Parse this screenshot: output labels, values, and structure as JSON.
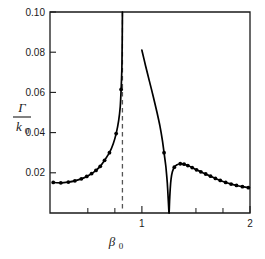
{
  "chart_data": {
    "type": "line",
    "title": "",
    "subtitle": "",
    "xlabel": "β₀",
    "ylabel": "Γ / k₀",
    "ylabel_numerator": "Γ",
    "ylabel_denominator": "k₀",
    "xlim": [
      0.15,
      2.0
    ],
    "ylim": [
      0.0,
      0.1
    ],
    "grid": false,
    "legend": null,
    "x_ticks_labeled": [
      1,
      2
    ],
    "x_tick_labels": [
      "1",
      "2"
    ],
    "x_ticks_minor": [
      0.5,
      0.75,
      1.25,
      1.5,
      1.75
    ],
    "y_ticks_labeled": [
      0.02,
      0.04,
      0.06,
      0.08,
      0.1
    ],
    "y_tick_labels": [
      "0.02",
      "0.04",
      "0.06",
      "0.08",
      "0.10"
    ],
    "annotations": [
      {
        "name": "vertical-asymptote",
        "type": "dashed-vertical-line",
        "x": 0.82,
        "label": ""
      }
    ],
    "series": [
      {
        "name": "lower-branch",
        "style": "solid-line-with-markers",
        "color": "#000000",
        "points": [
          [
            0.18,
            0.0152
          ],
          [
            0.25,
            0.015
          ],
          [
            0.32,
            0.0154
          ],
          [
            0.38,
            0.016
          ],
          [
            0.44,
            0.017
          ],
          [
            0.49,
            0.0182
          ],
          [
            0.535,
            0.0196
          ],
          [
            0.575,
            0.0212
          ],
          [
            0.615,
            0.0232
          ],
          [
            0.655,
            0.0262
          ],
          [
            0.7,
            0.03
          ],
          [
            0.735,
            0.0345
          ],
          [
            0.762,
            0.0395
          ],
          [
            0.785,
            0.046
          ],
          [
            0.8,
            0.053
          ],
          [
            0.808,
            0.0615
          ],
          [
            0.815,
            0.072
          ],
          [
            0.818,
            0.086
          ],
          [
            0.82,
            0.1
          ]
        ],
        "markers": [
          [
            0.18,
            0.0152
          ],
          [
            0.25,
            0.015
          ],
          [
            0.32,
            0.0154
          ],
          [
            0.38,
            0.016
          ],
          [
            0.44,
            0.017
          ],
          [
            0.49,
            0.0182
          ],
          [
            0.535,
            0.0196
          ],
          [
            0.575,
            0.0212
          ],
          [
            0.615,
            0.0232
          ],
          [
            0.655,
            0.0262
          ],
          [
            0.7,
            0.03
          ],
          [
            0.762,
            0.0395
          ],
          [
            0.808,
            0.0615
          ]
        ]
      },
      {
        "name": "upper-branch",
        "style": "solid-line-with-markers",
        "color": "#000000",
        "points": [
          [
            1.0,
            0.081
          ],
          [
            1.035,
            0.073
          ],
          [
            1.07,
            0.0655
          ],
          [
            1.105,
            0.058
          ],
          [
            1.14,
            0.05
          ],
          [
            1.168,
            0.043
          ],
          [
            1.19,
            0.036
          ],
          [
            1.205,
            0.03
          ],
          [
            1.222,
            0.023
          ],
          [
            1.235,
            0.015
          ],
          [
            1.243,
            0.0075
          ],
          [
            1.249,
            0.0015
          ],
          [
            1.252,
            0.0
          ],
          [
            1.256,
            0.006
          ],
          [
            1.262,
            0.012
          ],
          [
            1.27,
            0.017
          ],
          [
            1.282,
            0.0205
          ],
          [
            1.3,
            0.0228
          ],
          [
            1.325,
            0.024
          ],
          [
            1.355,
            0.0245
          ],
          [
            1.39,
            0.0243
          ],
          [
            1.425,
            0.0236
          ],
          [
            1.465,
            0.0226
          ],
          [
            1.505,
            0.0215
          ],
          [
            1.545,
            0.0205
          ],
          [
            1.59,
            0.0194
          ],
          [
            1.635,
            0.0183
          ],
          [
            1.68,
            0.0172
          ],
          [
            1.725,
            0.0162
          ],
          [
            1.775,
            0.0152
          ],
          [
            1.825,
            0.0144
          ],
          [
            1.875,
            0.0137
          ],
          [
            1.93,
            0.0131
          ],
          [
            1.985,
            0.0126
          ]
        ],
        "markers": [
          [
            1.205,
            0.03
          ],
          [
            1.3,
            0.0228
          ],
          [
            1.355,
            0.0245
          ],
          [
            1.39,
            0.0243
          ],
          [
            1.425,
            0.0236
          ],
          [
            1.465,
            0.0226
          ],
          [
            1.505,
            0.0215
          ],
          [
            1.545,
            0.0205
          ],
          [
            1.59,
            0.0194
          ],
          [
            1.635,
            0.0183
          ],
          [
            1.68,
            0.0172
          ],
          [
            1.725,
            0.0162
          ],
          [
            1.775,
            0.0152
          ],
          [
            1.825,
            0.0144
          ],
          [
            1.875,
            0.0137
          ],
          [
            1.93,
            0.0131
          ],
          [
            1.985,
            0.0126
          ]
        ]
      }
    ]
  }
}
